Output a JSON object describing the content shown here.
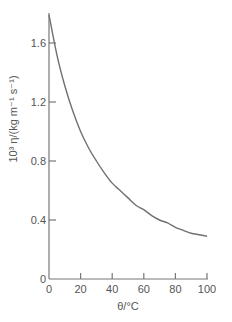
{
  "chart_data": {
    "type": "line",
    "title": "",
    "xlabel": "θ/°C",
    "ylabel": "10³ η/(kg m⁻¹ s⁻¹)",
    "xlim": [
      0,
      100
    ],
    "ylim": [
      0,
      1.8
    ],
    "x_ticks": [
      0,
      20,
      40,
      60,
      80,
      100
    ],
    "x_tick_labels": [
      "0",
      "20",
      "40",
      "60",
      "80",
      "100"
    ],
    "y_ticks": [
      0,
      0.4,
      0.8,
      1.2,
      1.6
    ],
    "y_tick_labels": [
      "0",
      "0.4",
      "0.8",
      "1.2",
      "1.6"
    ],
    "grid": false,
    "legend": null,
    "series": [
      {
        "name": "viscosity",
        "x": [
          0,
          5,
          10,
          15,
          20,
          25,
          30,
          35,
          40,
          45,
          50,
          55,
          60,
          65,
          70,
          75,
          80,
          85,
          90,
          95,
          100
        ],
        "values": [
          1.79,
          1.52,
          1.31,
          1.14,
          1.0,
          0.89,
          0.8,
          0.72,
          0.65,
          0.6,
          0.55,
          0.5,
          0.47,
          0.43,
          0.4,
          0.38,
          0.35,
          0.33,
          0.31,
          0.3,
          0.29
        ]
      }
    ]
  }
}
